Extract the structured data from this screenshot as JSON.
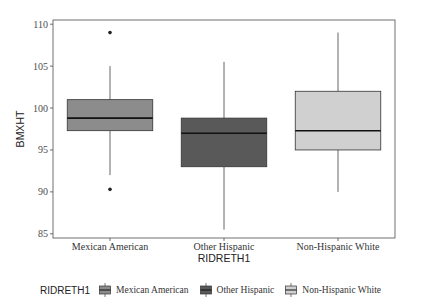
{
  "chart_data": {
    "type": "boxplot",
    "title": "",
    "xlabel": "RIDRETH1",
    "ylabel": "BMXHT",
    "ylim": [
      84.5,
      110.5
    ],
    "yticks": [
      85,
      90,
      95,
      100,
      105,
      110
    ],
    "ytick_labels": [
      "85",
      "90",
      "95",
      "100",
      "105",
      "110"
    ],
    "categories": [
      "Mexican American",
      "Other Hispanic",
      "Non-Hispanic White"
    ],
    "grid": false,
    "legend_position": "bottom",
    "legend_title": "RIDRETH1",
    "series": [
      {
        "name": "Mexican American",
        "color": "#8c8c8c",
        "whisker_low": 92,
        "q1": 97.3,
        "median": 98.8,
        "q3": 101,
        "whisker_high": 105,
        "outliers": [
          109,
          90.3
        ]
      },
      {
        "name": "Other Hispanic",
        "color": "#595959",
        "whisker_low": 85.5,
        "q1": 93,
        "median": 97,
        "q3": 98.8,
        "whisker_high": 105.5,
        "outliers": []
      },
      {
        "name": "Non-Hispanic White",
        "color": "#d0d0d0",
        "whisker_low": 90,
        "q1": 95,
        "median": 97.3,
        "q3": 102,
        "whisker_high": 109,
        "outliers": []
      }
    ]
  },
  "legend": {
    "title": "RIDRETH1",
    "items": [
      {
        "label": "Mexican American",
        "color": "#8c8c8c"
      },
      {
        "label": "Other Hispanic",
        "color": "#595959"
      },
      {
        "label": "Non-Hispanic White",
        "color": "#d0d0d0"
      }
    ]
  }
}
